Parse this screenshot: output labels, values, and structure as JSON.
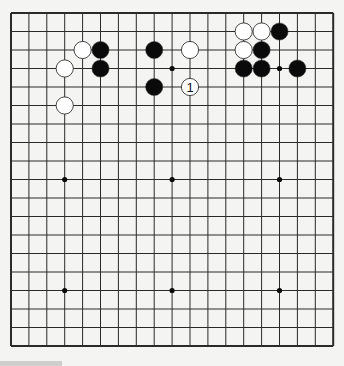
{
  "board": {
    "size": 19,
    "origin_x": 11,
    "origin_y": 13,
    "spacing_x": 17.9,
    "spacing_y": 18.5,
    "colors": {
      "background": "#f4f4f2",
      "line": "#2a2a2a",
      "black_stone": "#0a0a0a",
      "white_stone": "#ffffff",
      "stone_stroke": "#333333"
    },
    "star_points": [
      [
        3,
        3
      ],
      [
        9,
        3
      ],
      [
        15,
        3
      ],
      [
        3,
        9
      ],
      [
        9,
        9
      ],
      [
        15,
        9
      ],
      [
        3,
        15
      ],
      [
        9,
        15
      ],
      [
        15,
        15
      ]
    ],
    "stones": [
      {
        "color": "white",
        "col": 4,
        "row": 2,
        "label": ""
      },
      {
        "color": "white",
        "col": 3,
        "row": 3,
        "label": ""
      },
      {
        "color": "white",
        "col": 3,
        "row": 5,
        "label": ""
      },
      {
        "color": "black",
        "col": 5,
        "row": 2,
        "label": ""
      },
      {
        "color": "black",
        "col": 5,
        "row": 3,
        "label": ""
      },
      {
        "color": "black",
        "col": 8,
        "row": 2,
        "label": ""
      },
      {
        "color": "black",
        "col": 8,
        "row": 4,
        "label": ""
      },
      {
        "color": "white",
        "col": 10,
        "row": 2,
        "label": ""
      },
      {
        "color": "white",
        "col": 10,
        "row": 4,
        "label": "1"
      },
      {
        "color": "white",
        "col": 13,
        "row": 1,
        "label": ""
      },
      {
        "color": "white",
        "col": 14,
        "row": 1,
        "label": ""
      },
      {
        "color": "black",
        "col": 15,
        "row": 1,
        "label": ""
      },
      {
        "color": "white",
        "col": 13,
        "row": 2,
        "label": ""
      },
      {
        "color": "black",
        "col": 14,
        "row": 2,
        "label": ""
      },
      {
        "color": "black",
        "col": 13,
        "row": 3,
        "label": ""
      },
      {
        "color": "black",
        "col": 14,
        "row": 3,
        "label": ""
      },
      {
        "color": "black",
        "col": 16,
        "row": 3,
        "label": ""
      }
    ]
  }
}
